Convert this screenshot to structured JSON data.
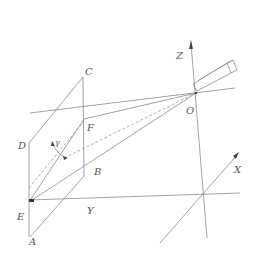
{
  "diagram": {
    "type": "camera-projection-geometry",
    "labels": {
      "C": "C",
      "D": "D",
      "F": "F",
      "gamma": "γ",
      "B": "B",
      "E": "E",
      "A": "A",
      "Y": "Y",
      "O": "O",
      "Z": "Z",
      "X": "X"
    },
    "colors": {
      "line": "#8a8a8a",
      "text": "#555555",
      "background": "#ffffff"
    }
  }
}
